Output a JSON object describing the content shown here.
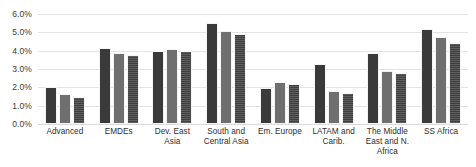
{
  "chart_data": {
    "type": "bar",
    "title": "",
    "xlabel": "",
    "ylabel": "",
    "ylim": [
      0,
      6
    ],
    "ytick_step": 1,
    "ytick_labels": [
      "6.0%",
      "5.0%",
      "4.0%",
      "3.0%",
      "2.0%",
      "1.0%",
      "0.0%"
    ],
    "ytick_values": [
      6.0,
      5.0,
      4.0,
      3.0,
      2.0,
      1.0,
      0.0
    ],
    "grid": true,
    "legend": "none",
    "categories": [
      "Advanced",
      "EMDEs",
      "Dev. East Asia",
      "South and Central Asia",
      "Em. Europe",
      "LATAM and Carib.",
      "The Middle East and N. Africa",
      "SS Africa"
    ],
    "series": [
      {
        "name": "series-1",
        "color": "#3a3a3a",
        "values": [
          2.0,
          4.15,
          4.0,
          5.5,
          1.95,
          3.25,
          3.85,
          5.2
        ]
      },
      {
        "name": "series-2",
        "color": "#6f6f6f",
        "values": [
          1.65,
          3.85,
          4.1,
          5.1,
          2.3,
          1.8,
          2.9,
          4.75
        ]
      },
      {
        "name": "series-3",
        "color": "#3f3f3f",
        "values": [
          1.5,
          3.75,
          4.0,
          4.9,
          2.2,
          1.7,
          2.8,
          4.4
        ]
      }
    ]
  },
  "caption": {
    "clipped_text": ""
  }
}
